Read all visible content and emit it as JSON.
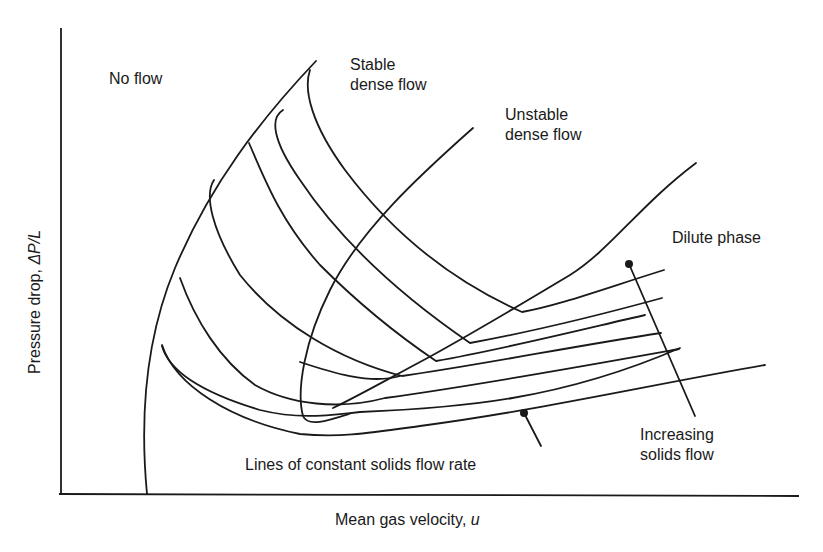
{
  "diagram": {
    "axes": {
      "x_label": "Mean gas velocity, ",
      "x_symbol": "u",
      "y_label": "Pressure drop, ",
      "y_symbol": "ΔP/L"
    },
    "regions": {
      "no_flow": "No flow",
      "stable_dense_flow_line1": "Stable",
      "stable_dense_flow_line2": "dense flow",
      "unstable_dense_flow_line1": "Unstable",
      "unstable_dense_flow_line2": "dense flow",
      "dilute_phase": "Dilute phase"
    },
    "annotations": {
      "constant_solids_lines": "Lines of constant solids flow rate",
      "increasing_solids_line1": "Increasing",
      "increasing_solids_line2": "solids flow"
    },
    "colors": {
      "line": "#1a1a1a",
      "background": "#ffffff"
    }
  }
}
